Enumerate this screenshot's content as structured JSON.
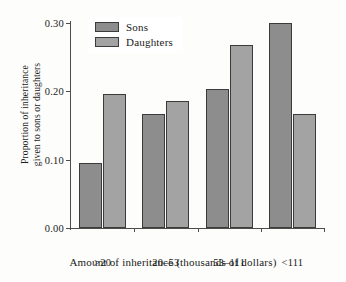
{
  "chart_data": {
    "type": "bar",
    "title": "",
    "xlabel": "Amount of inheritance (thousands of dollars)",
    "ylabel_line1": "Proportion of inheritance",
    "ylabel_line2": "given to sons or daughters",
    "categories": [
      ">20",
      "20–53",
      "53–111",
      "<111"
    ],
    "series": [
      {
        "name": "Sons",
        "color": "#8d8d8d",
        "values": [
          0.095,
          0.167,
          0.203,
          0.3
        ]
      },
      {
        "name": "Daughters",
        "color": "#a3a3a3",
        "values": [
          0.196,
          0.186,
          0.268,
          0.167
        ]
      }
    ],
    "ylim": [
      0.0,
      0.3
    ],
    "yticks": [
      0.0,
      0.1,
      0.2,
      0.3
    ],
    "ytick_labels": [
      "0.00",
      "0.10",
      "0.20",
      "0.30"
    ],
    "grid": false,
    "legend_position": "top-left"
  },
  "legend": {
    "items": [
      {
        "label": "Sons"
      },
      {
        "label": "Daughters"
      }
    ]
  }
}
